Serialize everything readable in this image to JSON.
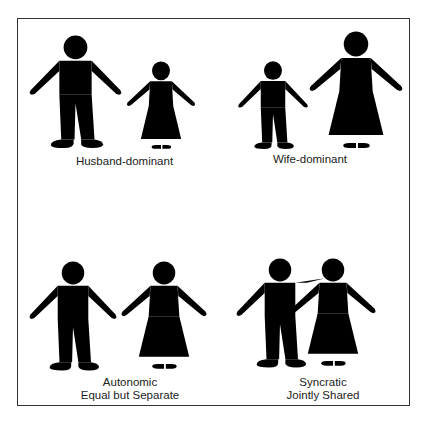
{
  "diagram": {
    "panels": [
      {
        "id": "husband-dominant",
        "label_lines": [
          "Husband-dominant"
        ],
        "figures": [
          {
            "type": "man",
            "size": "large"
          },
          {
            "type": "woman",
            "size": "small"
          }
        ]
      },
      {
        "id": "wife-dominant",
        "label_lines": [
          "Wife-dominant"
        ],
        "figures": [
          {
            "type": "man",
            "size": "small"
          },
          {
            "type": "woman",
            "size": "large"
          }
        ]
      },
      {
        "id": "autonomic",
        "label_lines": [
          "Autonomic",
          "Equal but Separate"
        ],
        "figures": [
          {
            "type": "man",
            "size": "medium"
          },
          {
            "type": "woman",
            "size": "medium"
          }
        ]
      },
      {
        "id": "syncratic",
        "label_lines": [
          "Syncratic",
          "Jointly Shared"
        ],
        "figures": [
          {
            "type": "man",
            "size": "medium",
            "pose": "arm-around-partner"
          },
          {
            "type": "woman",
            "size": "medium"
          }
        ]
      }
    ],
    "colors": {
      "border": "#333333",
      "stroke": "#4a4a4a",
      "text": "#222222",
      "background": "#ffffff"
    }
  }
}
